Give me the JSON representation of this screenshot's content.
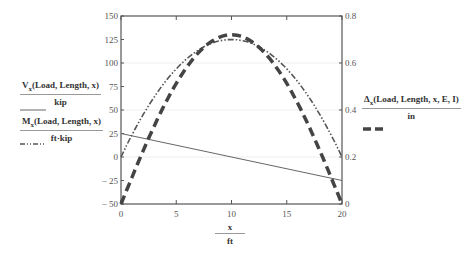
{
  "chart_data": {
    "type": "line",
    "title": "",
    "xlabel": "x / ft",
    "ylabel_left": "Vx(Load, Length, x)/kip ; Mx(Load, Length, x)/ft·kip",
    "ylabel_right": "Δx(Load, Length, x, E, I)/in",
    "x_ticks": [
      0,
      5,
      10,
      15,
      20
    ],
    "y_left_ticks": [
      -50,
      -25,
      0,
      25,
      50,
      75,
      100,
      125,
      150
    ],
    "y_right_ticks": [
      0,
      0.2,
      0.4,
      0.6,
      0.8
    ],
    "xlim": [
      0,
      20
    ],
    "ylim_left": [
      -50,
      150
    ],
    "ylim_right": [
      0,
      0.8
    ],
    "grid": "faint horizontal at right-axis ticks",
    "series": [
      {
        "name": "Vx(Load, Length, x)/kip",
        "axis": "left",
        "style": "solid thin",
        "x": [
          0,
          20
        ],
        "values": [
          25,
          -25
        ]
      },
      {
        "name": "Mx(Load, Length, x)/ft·kip",
        "axis": "left",
        "style": "dash-dot-dot",
        "x": [
          0,
          2,
          4,
          6,
          8,
          10,
          12,
          14,
          16,
          18,
          20
        ],
        "values": [
          0,
          45,
          80,
          105,
          120,
          125,
          120,
          105,
          80,
          45,
          0
        ]
      },
      {
        "name": "Δx(Load, Length, x, E, I)/in",
        "axis": "right",
        "style": "thick dashed",
        "x": [
          0,
          2,
          4,
          6,
          8,
          10,
          12,
          14,
          16,
          18,
          20
        ],
        "values": [
          0,
          0.22,
          0.42,
          0.58,
          0.68,
          0.72,
          0.68,
          0.58,
          0.42,
          0.22,
          0
        ]
      }
    ]
  },
  "legend": {
    "shear": {
      "func": "V",
      "sub": "x",
      "args": "(Load, Length, x)",
      "unit": "kip"
    },
    "moment": {
      "func": "M",
      "sub": "x",
      "args": "(Load, Length, x)",
      "unit": "ft·kip"
    },
    "deflection": {
      "func": "Δ",
      "sub": "x",
      "args": "(Load, Length, x, E, I)",
      "unit": "in"
    }
  },
  "x_axis": {
    "var": "x",
    "unit": "ft"
  }
}
